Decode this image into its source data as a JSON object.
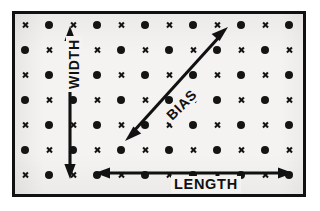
{
  "figure": {
    "name": "fabric-grain-direction-diagram",
    "frame": {
      "border_color": "#111111",
      "background_color": "#f4f3f1",
      "border_width_px": 3
    }
  },
  "grid": {
    "description": "Alternating cross and dot marks arranged in a regular lattice representing fabric yarn intersections",
    "columns": 12,
    "rows": 7,
    "origin_x": 10,
    "origin_y": 11,
    "step_x": 24,
    "step_y": 25,
    "mark_color": "#141414",
    "dot_symbol_name": "dot-mark",
    "cross_symbol_name": "cross-mark",
    "pattern": [
      [
        "cross",
        "dot",
        "cross",
        "dot",
        "cross",
        "dot",
        "cross",
        "dot",
        "cross",
        "dot",
        "cross",
        "dot"
      ],
      [
        "dot",
        "cross",
        "dot",
        "cross",
        "dot",
        "cross",
        "dot",
        "cross",
        "dot",
        "cross",
        "dot",
        "cross"
      ],
      [
        "cross",
        "dot",
        "cross",
        "dot",
        "cross",
        "dot",
        "cross",
        "dot",
        "cross",
        "dot",
        "cross",
        "dot"
      ],
      [
        "dot",
        "cross",
        "dot",
        "cross",
        "dot",
        "cross",
        "dot",
        "cross",
        "dot",
        "cross",
        "dot",
        "cross"
      ],
      [
        "cross",
        "dot",
        "cross",
        "dot",
        "cross",
        "dot",
        "cross",
        "dot",
        "cross",
        "dot",
        "cross",
        "dot"
      ],
      [
        "dot",
        "cross",
        "dot",
        "cross",
        "dot",
        "cross",
        "dot",
        "cross",
        "dot",
        "cross",
        "dot",
        "cross"
      ],
      [
        "cross",
        "dot",
        "cross",
        "dot",
        "cross",
        "dot",
        "cross",
        "dot",
        "cross",
        "dot",
        "cross",
        "dot"
      ]
    ]
  },
  "arrows": {
    "width": {
      "label": "WIDTH",
      "orientation": "vertical",
      "double_headed": true,
      "x": 55,
      "y1": 16,
      "y2": 161,
      "label_rotation_deg": -90
    },
    "length": {
      "label": "LENGTH",
      "orientation": "horizontal",
      "double_headed": true,
      "y": 159,
      "x1": 84,
      "x2": 274,
      "label_rotation_deg": 0
    },
    "bias": {
      "label": "BIAS",
      "orientation": "diagonal",
      "double_headed": true,
      "x1": 112,
      "y1": 123,
      "x2": 211,
      "y2": 16,
      "label_rotation_deg": -45
    }
  },
  "colors": {
    "ink": "#111111",
    "paper": "#f4f3f1",
    "page": "#ffffff"
  }
}
